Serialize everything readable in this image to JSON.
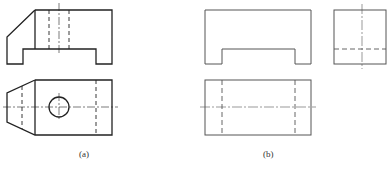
{
  "figure": {
    "panel_a": {
      "label": "(a)",
      "views": [
        "front-view",
        "top-view"
      ],
      "line_color": "#222222"
    },
    "panel_b": {
      "label": "(b)",
      "views": [
        "front-view",
        "side-view",
        "top-view"
      ],
      "line_color": "#555555"
    },
    "line_styles": {
      "visible": "solid",
      "hidden": "dashed",
      "center": "dash-dot"
    }
  }
}
